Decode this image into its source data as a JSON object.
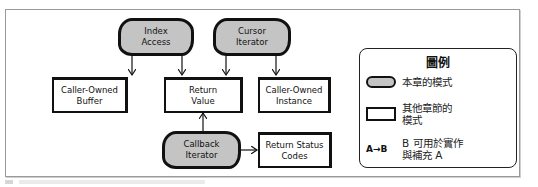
{
  "diagram": {
    "nodes": {
      "index_access": {
        "label_line1": "Index",
        "label_line2": "Access",
        "kind": "this-chapter-pattern"
      },
      "cursor_iterator": {
        "label_line1": "Cursor",
        "label_line2": "Iterator",
        "kind": "this-chapter-pattern"
      },
      "callback_iterator": {
        "label_line1": "Callback",
        "label_line2": "Iterator",
        "kind": "this-chapter-pattern"
      },
      "caller_owned_buffer": {
        "label_line1": "Caller-Owned",
        "label_line2": "Buffer",
        "kind": "other-chapter-pattern"
      },
      "return_value": {
        "label_line1": "Return",
        "label_line2": "Value",
        "kind": "other-chapter-pattern"
      },
      "caller_owned_instance": {
        "label_line1": "Caller-Owned",
        "label_line2": "Instance",
        "kind": "other-chapter-pattern"
      },
      "return_status_codes": {
        "label_line1": "Return Status",
        "label_line2": "Codes",
        "kind": "other-chapter-pattern"
      }
    },
    "edges": [
      {
        "from": "index_access",
        "to": "caller_owned_buffer"
      },
      {
        "from": "index_access",
        "to": "return_value"
      },
      {
        "from": "cursor_iterator",
        "to": "return_value"
      },
      {
        "from": "cursor_iterator",
        "to": "caller_owned_instance"
      },
      {
        "from": "callback_iterator",
        "to": "return_value"
      },
      {
        "from": "callback_iterator",
        "to": "return_status_codes"
      }
    ]
  },
  "legend": {
    "title": "圖例",
    "this_chapter": "本章的模式",
    "other_chapter_line1": "其他章節的",
    "other_chapter_line2": "模式",
    "arrow_symbol": "A→B",
    "arrow_desc_line1": "B 可用於實作",
    "arrow_desc_line2": "與補充 A",
    "colors": {
      "pattern_fill": "#c4c4c4",
      "outline": "#111111"
    }
  }
}
